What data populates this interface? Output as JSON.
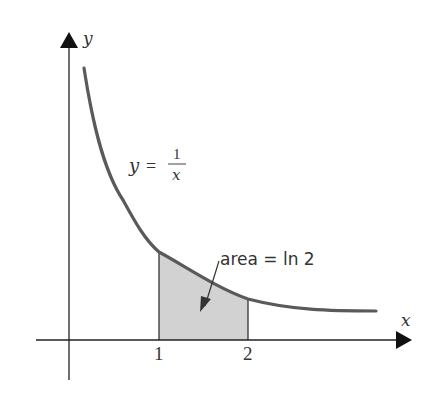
{
  "figure": {
    "y_axis_label": "y",
    "x_axis_label": "x",
    "curve_label": {
      "lhs": "y",
      "eq": "=",
      "numerator": "1",
      "denominator": "x"
    },
    "area_label": "area = ln 2",
    "ticks": [
      "1",
      "2"
    ],
    "colors": {
      "axis": "#222222",
      "curve": "#5a5a5a",
      "shade": "#cfcfcf",
      "text": "#333333"
    }
  }
}
